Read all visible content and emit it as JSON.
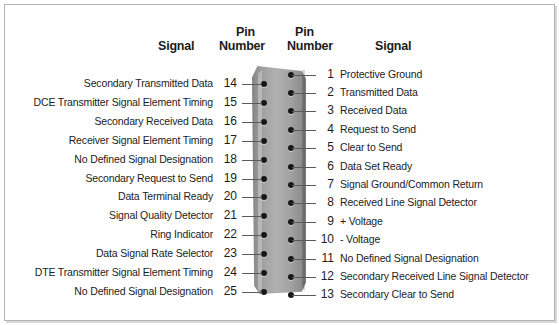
{
  "headers": {
    "left_signal": "Signal",
    "left_pin": "Pin",
    "left_number": "Number",
    "right_pin": "Pin",
    "right_number": "Number",
    "right_signal": "Signal"
  },
  "colors": {
    "frame_border": "#b3b3b3",
    "connector_body": "#a6a6a6",
    "pin": "#171717",
    "leader_line": "#5a5a5a",
    "text": "#1c1c1c",
    "background": "#ffffff"
  },
  "connector": {
    "type": "DB-25",
    "pin_count": 25
  },
  "left_column": [
    {
      "pin": "14",
      "signal": "Secondary Transmitted Data"
    },
    {
      "pin": "15",
      "signal": "DCE Transmitter Signal Element Timing"
    },
    {
      "pin": "16",
      "signal": "Secondary Received Data"
    },
    {
      "pin": "17",
      "signal": "Receiver Signal Element Timing"
    },
    {
      "pin": "18",
      "signal": "No Defined Signal Designation"
    },
    {
      "pin": "19",
      "signal": "Secondary Request to Send"
    },
    {
      "pin": "20",
      "signal": "Data Terminal Ready"
    },
    {
      "pin": "21",
      "signal": "Signal Quality Detector"
    },
    {
      "pin": "22",
      "signal": "Ring Indicator"
    },
    {
      "pin": "23",
      "signal": "Data Signal Rate Selector"
    },
    {
      "pin": "24",
      "signal": "DTE Transmitter Signal Element Timing"
    },
    {
      "pin": "25",
      "signal": "No Defined Signal Designation"
    }
  ],
  "right_column": [
    {
      "pin": "1",
      "signal": "Protective Ground"
    },
    {
      "pin": "2",
      "signal": "Transmitted Data"
    },
    {
      "pin": "3",
      "signal": "Received Data"
    },
    {
      "pin": "4",
      "signal": "Request to Send"
    },
    {
      "pin": "5",
      "signal": "Clear to Send"
    },
    {
      "pin": "6",
      "signal": "Data Set Ready"
    },
    {
      "pin": "7",
      "signal": "Signal Ground/Common Return"
    },
    {
      "pin": "8",
      "signal": "Received Line Signal Detector"
    },
    {
      "pin": "9",
      "signal": "+ Voltage"
    },
    {
      "pin": "10",
      "signal": "- Voltage"
    },
    {
      "pin": "11",
      "signal": "No Defined Signal Designation"
    },
    {
      "pin": "12",
      "signal": "Secondary Received Line Signal Detector"
    },
    {
      "pin": "13",
      "signal": "Secondary Clear to Send"
    }
  ]
}
